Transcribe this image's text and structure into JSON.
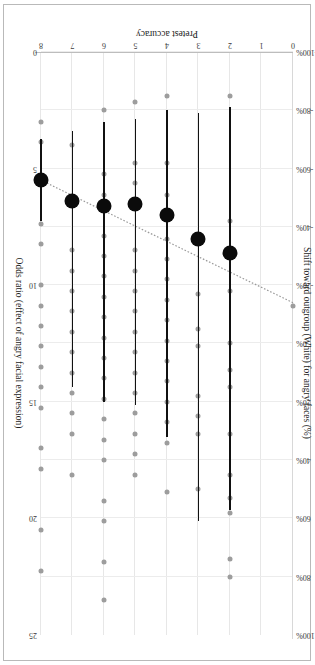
{
  "chart_data": {
    "type": "scatter",
    "title": "",
    "xlabel": "Pretest accuracy",
    "ylabel": "Shift toward outgroup (White) for angry faces (%)",
    "y2label": "Odds ratio (effect of angry facial expression)",
    "xlim": [
      0,
      8
    ],
    "ylim": [
      -100,
      100
    ],
    "y2lim": [
      0,
      25
    ],
    "grid": true,
    "legend": "none",
    "xticks": [
      "0",
      "1",
      "2",
      "3",
      "4",
      "5",
      "6",
      "7",
      "8"
    ],
    "yticks": [
      "100%",
      "80%",
      "60%",
      "40%",
      "20%",
      "0%",
      "-20%",
      "-40%",
      "-60%",
      "-80%",
      "-100%"
    ],
    "y2ticks": [
      "0",
      "5",
      "10",
      "15",
      "20",
      "25"
    ],
    "series": [
      {
        "name": "Group mean shift",
        "marker": "large-black-circle",
        "x": [
          2,
          3,
          4,
          5,
          6,
          7,
          8
        ],
        "y": [
          -31,
          -36,
          -44,
          -48,
          -47,
          -49,
          -56
        ],
        "err_low": [
          -81,
          -79,
          -80,
          -77,
          -76,
          -73,
          -70
        ],
        "err_high": [
          57,
          61,
          32,
          21,
          20,
          15,
          -42
        ]
      },
      {
        "name": "Individual participants",
        "marker": "small-gray-circle",
        "points": [
          {
            "x": 0,
            "y": -13
          },
          {
            "x": 2,
            "y": -85
          },
          {
            "x": 2,
            "y": -42
          },
          {
            "x": 2,
            "y": -18
          },
          {
            "x": 2,
            "y": 0
          },
          {
            "x": 2,
            "y": 9
          },
          {
            "x": 2,
            "y": 15
          },
          {
            "x": 2,
            "y": 31
          },
          {
            "x": 2,
            "y": 45
          },
          {
            "x": 2,
            "y": 53
          },
          {
            "x": 2,
            "y": 58
          },
          {
            "x": 2,
            "y": 74
          },
          {
            "x": 2,
            "y": 80
          },
          {
            "x": 3,
            "y": -17
          },
          {
            "x": 3,
            "y": -5
          },
          {
            "x": 3,
            "y": 1
          },
          {
            "x": 3,
            "y": 18
          },
          {
            "x": 3,
            "y": 25
          },
          {
            "x": 3,
            "y": 31
          },
          {
            "x": 3,
            "y": 50
          },
          {
            "x": 4,
            "y": -85
          },
          {
            "x": 4,
            "y": -62
          },
          {
            "x": 4,
            "y": -51
          },
          {
            "x": 4,
            "y": -36
          },
          {
            "x": 4,
            "y": -29
          },
          {
            "x": 4,
            "y": -22
          },
          {
            "x": 4,
            "y": -15
          },
          {
            "x": 4,
            "y": -8
          },
          {
            "x": 4,
            "y": -1
          },
          {
            "x": 4,
            "y": 6
          },
          {
            "x": 4,
            "y": 13
          },
          {
            "x": 4,
            "y": 20
          },
          {
            "x": 4,
            "y": 27
          },
          {
            "x": 4,
            "y": 34
          },
          {
            "x": 4,
            "y": 51
          },
          {
            "x": 5,
            "y": -83
          },
          {
            "x": 5,
            "y": -62
          },
          {
            "x": 5,
            "y": -55
          },
          {
            "x": 5,
            "y": -48
          },
          {
            "x": 5,
            "y": -32
          },
          {
            "x": 5,
            "y": -25
          },
          {
            "x": 5,
            "y": -18
          },
          {
            "x": 5,
            "y": -11
          },
          {
            "x": 5,
            "y": -4
          },
          {
            "x": 5,
            "y": 3
          },
          {
            "x": 5,
            "y": 10
          },
          {
            "x": 5,
            "y": 17
          },
          {
            "x": 5,
            "y": 24
          },
          {
            "x": 5,
            "y": 31
          },
          {
            "x": 5,
            "y": 38
          },
          {
            "x": 5,
            "y": 45
          },
          {
            "x": 6,
            "y": -80
          },
          {
            "x": 6,
            "y": -58
          },
          {
            "x": 6,
            "y": -51
          },
          {
            "x": 6,
            "y": -37
          },
          {
            "x": 6,
            "y": -30
          },
          {
            "x": 6,
            "y": -23
          },
          {
            "x": 6,
            "y": -16
          },
          {
            "x": 6,
            "y": -9
          },
          {
            "x": 6,
            "y": -2
          },
          {
            "x": 6,
            "y": 5
          },
          {
            "x": 6,
            "y": 12
          },
          {
            "x": 6,
            "y": 19
          },
          {
            "x": 6,
            "y": 26
          },
          {
            "x": 6,
            "y": 33
          },
          {
            "x": 6,
            "y": 40
          },
          {
            "x": 6,
            "y": 54
          },
          {
            "x": 6,
            "y": 61
          },
          {
            "x": 6,
            "y": 75
          },
          {
            "x": 6,
            "y": 88
          },
          {
            "x": 7,
            "y": -68
          },
          {
            "x": 7,
            "y": -32
          },
          {
            "x": 7,
            "y": -25
          },
          {
            "x": 7,
            "y": -18
          },
          {
            "x": 7,
            "y": -11
          },
          {
            "x": 7,
            "y": -4
          },
          {
            "x": 7,
            "y": 3
          },
          {
            "x": 7,
            "y": 10
          },
          {
            "x": 7,
            "y": 17
          },
          {
            "x": 7,
            "y": 24
          },
          {
            "x": 7,
            "y": 31
          },
          {
            "x": 7,
            "y": 45
          },
          {
            "x": 8,
            "y": -76
          },
          {
            "x": 8,
            "y": -69
          },
          {
            "x": 8,
            "y": -41
          },
          {
            "x": 8,
            "y": -34
          },
          {
            "x": 8,
            "y": -20
          },
          {
            "x": 8,
            "y": -13
          },
          {
            "x": 8,
            "y": -6
          },
          {
            "x": 8,
            "y": 1
          },
          {
            "x": 8,
            "y": 8
          },
          {
            "x": 8,
            "y": 15
          },
          {
            "x": 8,
            "y": 22
          },
          {
            "x": 8,
            "y": 36
          },
          {
            "x": 8,
            "y": 43
          },
          {
            "x": 8,
            "y": 64
          },
          {
            "x": 8,
            "y": 78
          }
        ]
      },
      {
        "name": "Fitted trend",
        "marker": "dotted-line",
        "x": [
          0,
          8
        ],
        "y": [
          -14,
          -56
        ]
      }
    ]
  },
  "axes": {
    "x_title": "Pretest accuracy",
    "y_title": "Shift toward outgroup (White) for angry faces (%)",
    "y2_title": "Odds ratio (effect of angry facial expression)"
  }
}
